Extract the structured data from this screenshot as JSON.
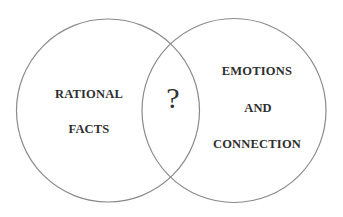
{
  "diagram": {
    "type": "venn",
    "circles": [
      {
        "id": "left",
        "lines": [
          "RATIONAL",
          "FACTS"
        ],
        "cx": 108,
        "cy": 110,
        "r": 92
      },
      {
        "id": "right",
        "lines": [
          "EMOTIONS",
          "AND",
          "CONNECTION"
        ],
        "cx": 234,
        "cy": 110,
        "r": 92
      }
    ],
    "intersection": {
      "label": "?"
    },
    "colors": {
      "stroke": "#8a8a8a",
      "text": "#2e2e2e",
      "background": "#ffffff"
    }
  }
}
